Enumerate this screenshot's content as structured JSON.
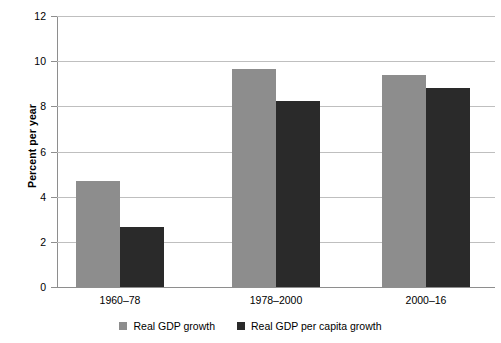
{
  "chart_data": {
    "type": "bar",
    "title": "",
    "subtitle": "",
    "xlabel": "",
    "ylabel": "Percent per year",
    "categories": [
      "1960–78",
      "1978–2000",
      "2000–16"
    ],
    "series": [
      {
        "name": "Real GDP growth",
        "color": "#8d8d8d",
        "values": [
          4.7,
          9.65,
          9.4
        ]
      },
      {
        "name": "Real GDP per capita growth",
        "color": "#2a2a2a",
        "values": [
          2.65,
          8.25,
          8.8
        ]
      }
    ],
    "ylim": [
      0,
      12
    ],
    "yticks": [
      0,
      2,
      4,
      6,
      8,
      10,
      12
    ],
    "ytick_labels": [
      "0",
      "2",
      "4",
      "6",
      "8",
      "10",
      "12"
    ],
    "grid": true,
    "grid_axis": "y",
    "legend_position": "bottom",
    "legend": [
      "Real GDP growth",
      "Real GDP per capita growth"
    ]
  },
  "axes": {
    "y_title": "Percent per year"
  },
  "colors": {
    "series_gdp": "#8d8d8d",
    "series_percapita": "#2a2a2a",
    "gridline": "#bfbfbf",
    "axis": "#8e8e8e",
    "background": "#ffffff"
  }
}
